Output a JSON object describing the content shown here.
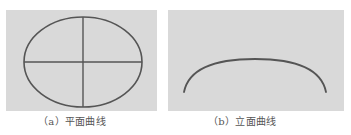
{
  "figure": {
    "panels": [
      {
        "id": "a",
        "caption": "（a）平面曲线",
        "shape": "ellipse-with-crosshair",
        "stroke_color": "#555555",
        "background": "#d9d9d9"
      },
      {
        "id": "b",
        "caption": "（b）立面曲线",
        "shape": "arc",
        "stroke_color": "#555555",
        "background": "#d9d9d9"
      }
    ]
  }
}
